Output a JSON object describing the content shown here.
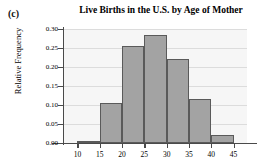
{
  "figure": {
    "panel_label": "(c)"
  },
  "chart_data": {
    "type": "bar",
    "title": "Live Births in the U.S. by Age of Mother",
    "xlabel": "",
    "ylabel": "Relative Frequency",
    "histogram": true,
    "bin_edges": [
      10,
      15,
      20,
      25,
      30,
      35,
      40,
      45
    ],
    "categories": [
      "10-15",
      "15-20",
      "20-25",
      "25-30",
      "30-35",
      "35-40",
      "40-45"
    ],
    "values": [
      0.005,
      0.105,
      0.256,
      0.285,
      0.222,
      0.115,
      0.02
    ],
    "xlim": [
      7,
      48
    ],
    "ylim": [
      0.0,
      0.3
    ],
    "x_ticks": [
      10,
      15,
      20,
      25,
      30,
      35,
      40,
      45
    ],
    "x_tick_labels": [
      "10",
      "15",
      "20",
      "25",
      "30",
      "35",
      "40",
      "45"
    ],
    "y_ticks": [
      0.0,
      0.05,
      0.1,
      0.15,
      0.2,
      0.25,
      0.3
    ],
    "y_tick_labels": [
      "0.00",
      "0.05",
      "0.10",
      "0.15",
      "0.20",
      "0.25",
      "0.30"
    ],
    "grid": true,
    "legend": false,
    "bar_fill_color": "#a3a3a3",
    "bar_edge_color": "#5a5a5a",
    "plot_background_color": "#f6f6f6",
    "gridline_color": "#dcdcdc",
    "axis_color": "#4a4a4a"
  }
}
